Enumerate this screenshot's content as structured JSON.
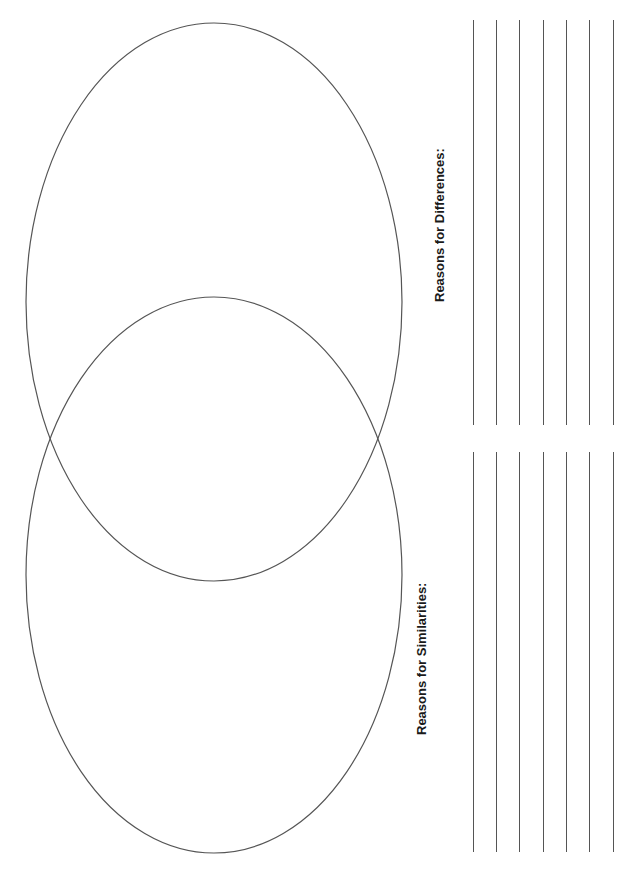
{
  "diagram": {
    "type": "venn",
    "circles": [
      {
        "name": "top-circle",
        "cx": 214,
        "cy": 302,
        "rx": 188,
        "ry": 279
      },
      {
        "name": "bottom-circle",
        "cx": 214,
        "cy": 575,
        "rx": 188,
        "ry": 278
      }
    ],
    "stroke_color": "#555555"
  },
  "labels": {
    "differences": "Reasons for Differences:",
    "similarities": "Reasons for Similarities:"
  },
  "writing_lines": {
    "x_positions": [
      473,
      496,
      519,
      543,
      566,
      589,
      613
    ],
    "groups": [
      {
        "name": "differences-lines",
        "top": 20,
        "bottom": 425
      },
      {
        "name": "similarities-lines",
        "top": 452,
        "bottom": 852
      }
    ]
  }
}
